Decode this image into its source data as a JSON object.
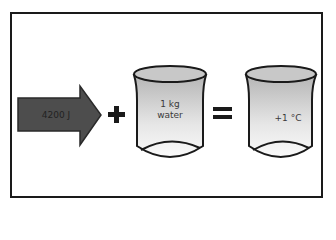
{
  "diagram": {
    "arrow": {
      "label": "4200 J",
      "color": "#4a4a4a"
    },
    "plus": "+",
    "beaker_input": {
      "line1": "1 kg",
      "line2": "water"
    },
    "equals": "=",
    "beaker_output": {
      "label": "+1 °C"
    }
  }
}
